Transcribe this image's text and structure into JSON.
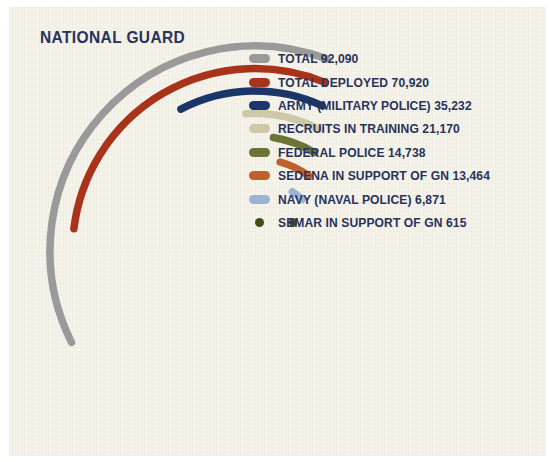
{
  "title": "NATIONAL GUARD",
  "background_color": "#f5f3ea",
  "text_color": "#28325a",
  "chart_data": {
    "type": "bar",
    "title": "NATIONAL GUARD",
    "subtitle": "",
    "xlabel": "",
    "ylabel": "",
    "orientation": "radial-arc",
    "note": "Nested concentric arcs; arc length encodes the value. Largest value is the outermost, longest arc.",
    "categories": [
      "TOTAL",
      "TOTAL DEPLOYED",
      "ARMY (MILITARY POLICE)",
      "RECRUITS IN TRAINING",
      "FEDERAL POLICE",
      "SEDENA IN SUPPORT OF GN",
      "NAVY (NAVAL POLICE)",
      "SEMAR IN SUPPORT OF GN"
    ],
    "values": [
      92090,
      70920,
      35232,
      21170,
      14738,
      13464,
      6871,
      615
    ],
    "value_labels": [
      "92,090",
      "70,920",
      "35,232",
      "21,170",
      "14,738",
      "13,464",
      "6,871",
      "615"
    ],
    "colors": [
      "#9a9a9a",
      "#a8331a",
      "#1b3668",
      "#cdc9a8",
      "#6b7436",
      "#c05e2e",
      "#9bb4d4",
      "#4a4a16"
    ],
    "legend_entries": [
      "TOTAL 92,090",
      "TOTAL DEPLOYED 70,920",
      "ARMY (MILITARY POLICE) 35,232",
      "RECRUITS IN TRAINING 21,170",
      "FEDERAL POLICE 14,738",
      "SEDENA IN SUPPORT OF GN 13,464",
      "NAVY (NAVAL POLICE) 6,871",
      "SEMAR IN SUPPORT OF GN 615"
    ],
    "legend_position": "right",
    "grid": false,
    "ylim": [
      0,
      92090
    ]
  },
  "legend": {
    "items": [
      {
        "label": "TOTAL 92,090",
        "color": "#9a9a9a",
        "value": 92090,
        "name": "TOTAL"
      },
      {
        "label": "TOTAL DEPLOYED 70,920",
        "color": "#a8331a",
        "value": 70920,
        "name": "TOTAL DEPLOYED"
      },
      {
        "label": "ARMY (MILITARY POLICE) 35,232",
        "color": "#1b3668",
        "value": 35232,
        "name": "ARMY (MILITARY POLICE)"
      },
      {
        "label": "RECRUITS IN TRAINING 21,170",
        "color": "#cdc9a8",
        "value": 21170,
        "name": "RECRUITS IN TRAINING"
      },
      {
        "label": "FEDERAL POLICE 14,738",
        "color": "#6b7436",
        "value": 14738,
        "name": "FEDERAL POLICE"
      },
      {
        "label": "SEDENA IN SUPPORT OF GN 13,464",
        "color": "#c05e2e",
        "value": 13464,
        "name": "SEDENA IN SUPPORT OF GN"
      },
      {
        "label": "NAVY (NAVAL POLICE) 6,871",
        "color": "#9bb4d4",
        "value": 6871,
        "name": "NAVY (NAVAL POLICE)"
      },
      {
        "label": "SEMAR IN SUPPORT OF GN 615",
        "color": "#4a4a16",
        "value": 615,
        "name": "SEMAR IN SUPPORT OF GN"
      }
    ]
  }
}
